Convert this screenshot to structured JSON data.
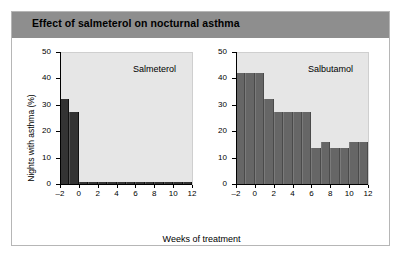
{
  "figure": {
    "title": "Effect of salmeterol on nocturnal asthma"
  },
  "chart_data": {
    "type": "bar",
    "title": "Effect of salmeterol on nocturnal asthma",
    "xlabel": "Weeks of treatment",
    "ylabel": "Nights with asthma (%)",
    "xlim": [
      -2,
      12
    ],
    "ylim": [
      0,
      50
    ],
    "ytick_labels": [
      "0",
      "10",
      "20",
      "30",
      "40",
      "50"
    ],
    "ytick_values": [
      0,
      10,
      20,
      30,
      40,
      50
    ],
    "xtick_labels": [
      "–2",
      "0",
      "2",
      "4",
      "6",
      "8",
      "10",
      "12"
    ],
    "xtick_values": [
      -2,
      0,
      2,
      4,
      6,
      8,
      10,
      12
    ],
    "grid": false,
    "legend_position": "none",
    "panels": [
      {
        "name": "Salmeterol",
        "bar_color": "#333333",
        "x": [
          -2,
          -1,
          0,
          1,
          2,
          3,
          4,
          5,
          6,
          7,
          8,
          9,
          10,
          11
        ],
        "values": [
          32.5,
          27.5,
          1.2,
          1.2,
          1.2,
          1.2,
          1.2,
          1.2,
          1.2,
          1.2,
          1.2,
          1.2,
          1.2,
          1.2
        ]
      },
      {
        "name": "Salbutamol",
        "bar_color": "#666666",
        "x": [
          -2,
          -1,
          0,
          1,
          2,
          3,
          4,
          5,
          6,
          7,
          8,
          9,
          10,
          11
        ],
        "values": [
          42.5,
          42.5,
          42.5,
          32.5,
          27.5,
          27.5,
          27.5,
          27.5,
          14.0,
          16.2,
          14.0,
          14.0,
          16.2,
          16.2
        ]
      }
    ]
  }
}
